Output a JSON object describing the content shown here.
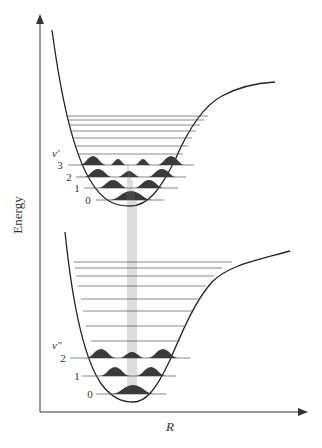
{
  "diagram": {
    "axes": {
      "y_label": "Energy",
      "x_label": "R"
    },
    "upper_state": {
      "label": "v′",
      "level_labels": [
        "3",
        "2",
        "1",
        "0"
      ]
    },
    "lower_state": {
      "label": "v″",
      "level_labels": [
        "2",
        "1",
        "0"
      ]
    },
    "colors": {
      "line": "#222222",
      "wavefunction": "#3a3a3a",
      "levels": "#555555",
      "background": "#ffffff"
    }
  }
}
